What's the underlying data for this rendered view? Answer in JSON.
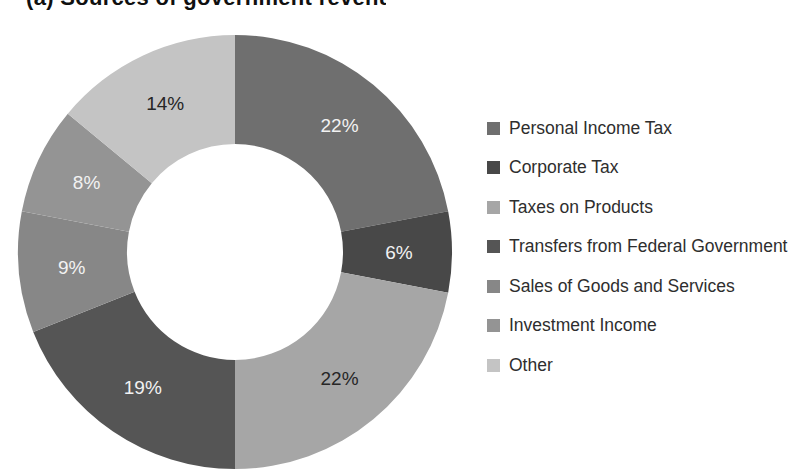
{
  "page": {
    "background": "#ffffff"
  },
  "clipped_title": {
    "text": "(a) Sources of government revenue",
    "clipped": true
  },
  "chart_data": {
    "type": "pie",
    "donut": true,
    "start_angle_deg": 0,
    "direction": "clockwise",
    "hole_ratio": 0.5,
    "legend_position": "right",
    "title": "",
    "slices": [
      {
        "label": "Personal Income Tax",
        "value": 22,
        "color": "#6f6f6f",
        "label_color": "#f2f2f2"
      },
      {
        "label": "Corporate Tax",
        "value": 6,
        "color": "#484848",
        "label_color": "#f2f2f2"
      },
      {
        "label": "Taxes on Products",
        "value": 22,
        "color": "#a6a6a6",
        "label_color": "#262626"
      },
      {
        "label": "Transfers from Federal Government",
        "value": 19,
        "color": "#555555",
        "label_color": "#f2f2f2"
      },
      {
        "label": "Sales of Goods and Services",
        "value": 9,
        "color": "#878787",
        "label_color": "#f2f2f2"
      },
      {
        "label": "Investment Income",
        "value": 8,
        "color": "#949494",
        "label_color": "#f2f2f2"
      },
      {
        "label": "Other",
        "value": 14,
        "color": "#c4c4c4",
        "label_color": "#262626"
      }
    ],
    "data_labels": [
      "22%",
      "6%",
      "22%",
      "19%",
      "9%",
      "8%",
      "14%"
    ]
  }
}
